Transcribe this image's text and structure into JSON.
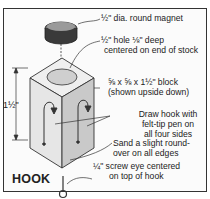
{
  "diagram": {
    "title": "HOOK",
    "dimension_label": "1½\"",
    "labels": {
      "magnet": "½\" dia. round magnet",
      "hole_line1": "½\" hole ⅛\" deep",
      "hole_line2": "centered on end of stock",
      "block_line1": "⅝ x ⅝ x 1½\" block",
      "block_line2": "(shown upside down)",
      "draw_line1": "Draw hook with",
      "draw_line2": "felt-tip pen on",
      "draw_line3": "all four sides",
      "sand_line1": "Sand a slight round-",
      "sand_line2": "over on all edges",
      "screw_line1": "¼\" screw eye centered",
      "screw_line2": "on top of hook"
    },
    "parts": [
      "magnet-icon",
      "block-icon",
      "hook-drawing-icon",
      "screw-eye-icon"
    ],
    "colors": {
      "line": "#333333",
      "block_light": "#e8e8e8",
      "block_dark": "#bdbdbd",
      "magnet_dark": "#3a3a3a"
    }
  }
}
